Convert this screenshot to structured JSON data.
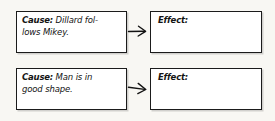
{
  "worksheet": {
    "type": "cause-and-effect graphic organizer",
    "background_color": "#f8f7f3",
    "box_fill": "#ffffff",
    "box_border_color": "#1b1b1b",
    "text_color": "#141414",
    "rows": [
      {
        "cause": {
          "label": "Cause:",
          "text": " Dillard fol-\nlows Mikey.",
          "full_text": "Dillard follows Mikey."
        },
        "arrow": {
          "icon": "arrow-right-icon",
          "direction": "right",
          "style": "hand-drawn"
        },
        "effect": {
          "label": "Effect:",
          "text": "",
          "placeholder": ""
        }
      },
      {
        "cause": {
          "label": "Cause:",
          "text": " Man is in\ngood shape.",
          "full_text": "Man is in good shape."
        },
        "arrow": {
          "icon": "arrow-right-icon",
          "direction": "right",
          "style": "hand-drawn slanted"
        },
        "effect": {
          "label": "Effect:",
          "text": "",
          "placeholder": ""
        }
      }
    ]
  }
}
